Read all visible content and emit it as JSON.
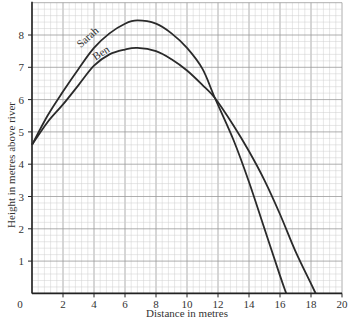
{
  "chart_data": {
    "type": "line",
    "title": "",
    "xlabel": "Distance in metres",
    "ylabel": "Height in metres above river",
    "xlim": [
      0,
      20
    ],
    "ylim": [
      0,
      9
    ],
    "x_ticks": [
      0,
      2,
      4,
      6,
      8,
      10,
      12,
      14,
      16,
      18,
      20
    ],
    "y_ticks": [
      1,
      2,
      3,
      4,
      5,
      6,
      7,
      8
    ],
    "grid": true,
    "legend": "inline labels on curves",
    "series": [
      {
        "name": "Sarah",
        "color": "#2a2a2a",
        "x": [
          0,
          1,
          2,
          3,
          4,
          5,
          6,
          6.8,
          8,
          9,
          10,
          11,
          11.8,
          13,
          14,
          15,
          16,
          16.4
        ],
        "y": [
          4.6,
          5.5,
          6.25,
          6.95,
          7.6,
          8.05,
          8.35,
          8.45,
          8.35,
          8.05,
          7.6,
          6.95,
          6.05,
          4.75,
          3.45,
          2.0,
          0.55,
          0
        ]
      },
      {
        "name": "Ben",
        "color": "#2a2a2a",
        "x": [
          0,
          1,
          2,
          3,
          4,
          5,
          6,
          6.8,
          8,
          9,
          10,
          11,
          11.8,
          13,
          14,
          15,
          16,
          17,
          18,
          18.3
        ],
        "y": [
          4.6,
          5.3,
          5.85,
          6.45,
          7.05,
          7.4,
          7.55,
          7.6,
          7.5,
          7.25,
          6.9,
          6.45,
          6.05,
          5.2,
          4.4,
          3.5,
          2.45,
          1.3,
          0.3,
          0
        ]
      }
    ]
  },
  "labels": {
    "x_axis": "Distance in metres",
    "y_axis": "Height in metres above river",
    "sarah": "Sarah",
    "ben": "Ben",
    "origin": "0"
  }
}
